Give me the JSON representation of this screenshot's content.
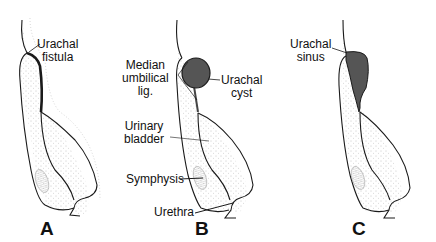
{
  "diagram": {
    "panels": [
      {
        "letter": "A",
        "label_lines": [
          "Urachal",
          "fistula"
        ]
      },
      {
        "letter": "B",
        "labels": {
          "median_umbilical_lig": [
            "Median",
            "umbilical",
            "lig."
          ],
          "urachal_cyst": [
            "Urachal",
            "cyst"
          ],
          "urinary_bladder": [
            "Urinary",
            "bladder"
          ],
          "symphysis": "Symphysis",
          "urethra": "Urethra"
        }
      },
      {
        "letter": "C",
        "label_lines": [
          "Urachal",
          "sinus"
        ]
      }
    ],
    "colors": {
      "line": "#1a1a1a",
      "lesion_fill": "#555555",
      "stipple": "#9a9a9a",
      "background": "#ffffff"
    }
  }
}
